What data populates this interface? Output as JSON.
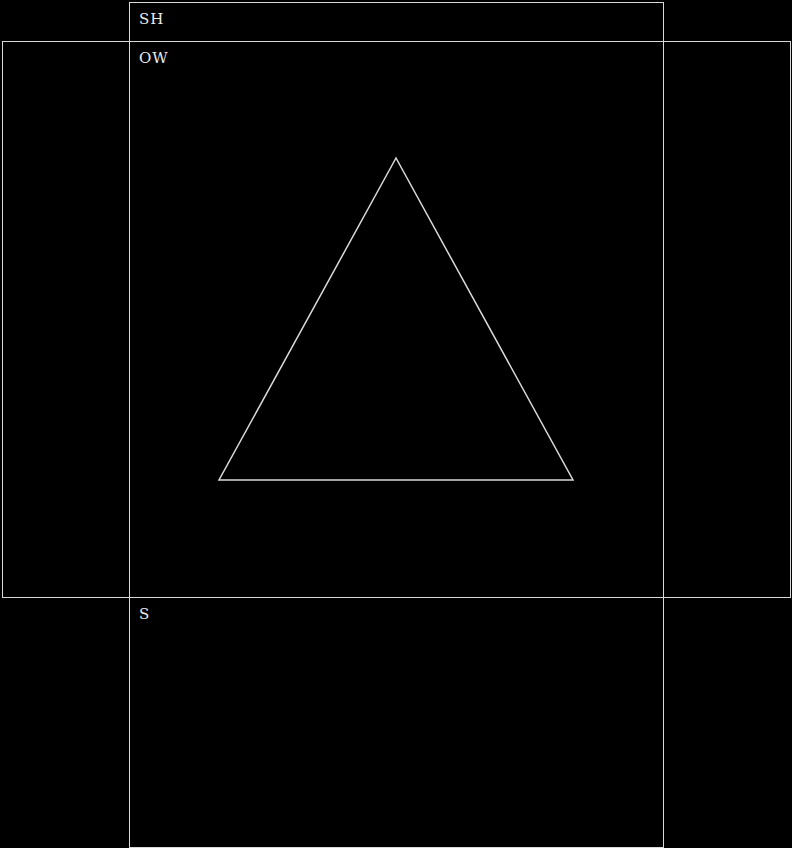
{
  "diagram": {
    "labels": {
      "top_panel": "SH",
      "main_panel": "OW",
      "bottom_panel": "S"
    },
    "shapes": {
      "triangle": {
        "points": "396,158 219,480 573,480",
        "stroke": "#d9d9d9"
      }
    },
    "colors": {
      "background": "#000000",
      "line": "#d9d9d9",
      "text": "#ececec"
    }
  }
}
